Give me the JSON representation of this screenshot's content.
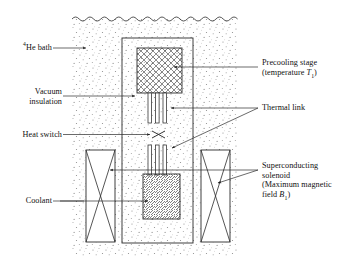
{
  "figure": {
    "background_color": "#ffffff",
    "line_color": "#1a1a1a",
    "stipple_color": "#9a9a9a"
  },
  "labels": {
    "he_bath": {
      "prefix_superscript": "4",
      "text": "He bath",
      "full": "4He bath"
    },
    "vacuum_insulation": {
      "line1": "Vacuum",
      "line2": "insulation"
    },
    "heat_switch": {
      "text": "Heat switch"
    },
    "coolant": {
      "text": "Coolant"
    },
    "precooling_stage": {
      "line1": "Precooling stage",
      "line2_pre": "(temperature ",
      "line2_sym": "T",
      "line2_sub": "1",
      "line2_post": ")"
    },
    "thermal_link": {
      "text": "Thermal link"
    },
    "superconducting_solenoid": {
      "line1": "Superconducting",
      "line2": "solenoid",
      "line3": "(Maximum magnetic",
      "line4_pre": "field ",
      "line4_sym": "B",
      "line4_sub": "1",
      "line4_post": ")"
    }
  },
  "components": {
    "liquid_surface": "wavy-line",
    "bath_region": "stippled-fill",
    "vacuum_chamber": "outer-rectangle",
    "precooling_block": "cross-hatched-box",
    "thermal_link_upper": "three-vertical-bars",
    "thermal_link_lower": "three-vertical-bars",
    "heat_switch_symbol": "bowtie-x",
    "sample_block": "diagonal-hatched-box",
    "solenoid_left": "tall-rect-with-x",
    "solenoid_right": "tall-rect-with-x"
  }
}
